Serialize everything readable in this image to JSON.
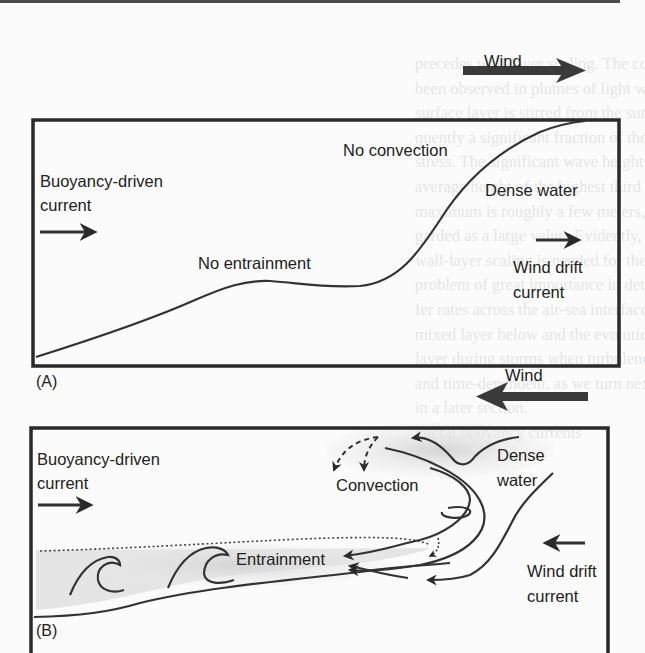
{
  "figure": {
    "panel_a": {
      "tag": "(A)",
      "wind_label": "Wind",
      "wind_direction": "right",
      "labels": {
        "buoyancy_line1": "Buoyancy-driven",
        "buoyancy_line2": "current",
        "no_convection": "No convection",
        "no_entrainment": "No entrainment",
        "dense_water": "Dense water",
        "wind_drift_line1": "Wind drift",
        "wind_drift_line2": "current"
      }
    },
    "panel_b": {
      "tag": "(B)",
      "wind_label": "Wind",
      "wind_direction": "left",
      "labels": {
        "buoyancy_line1": "Buoyancy-driven",
        "buoyancy_line2": "current",
        "convection": "Convection",
        "entrainment": "Entrainment",
        "dense_line1": "Dense",
        "dense_line2": "water",
        "wind_drift_line1": "Wind drift",
        "wind_drift_line2": "current"
      }
    },
    "colors": {
      "ink": "#2a2a2a",
      "shading": "#d9d9d9",
      "background": "#fbfbfb"
    }
  },
  "background_bleed_lines": [
    "precedes wall-layer scaling. The condition has",
    "been observed in plumes of light wall layers; the",
    "surface layer is stirred from the surface, and conse-",
    "quently a significant fraction of the surface wind",
    "stress. The significant wave height is defined as the",
    "average height of the highest third of waves; the",
    "maximum is roughly a few meters, commonly re-",
    "garded as a large value. Evidently, an alternative",
    "wall-layer scaling is needed for these cases. This is a",
    "problem of great importance in determining trans-",
    "fer rates across the air-sea interface to the",
    "mixed layer below and the evolution of the mixed",
    "layer during storms when turbulence is strong",
    "and time-dependent, as we turn next to consider",
    "in a later section.",
    "",
    "lateral buoyancy currents"
  ]
}
